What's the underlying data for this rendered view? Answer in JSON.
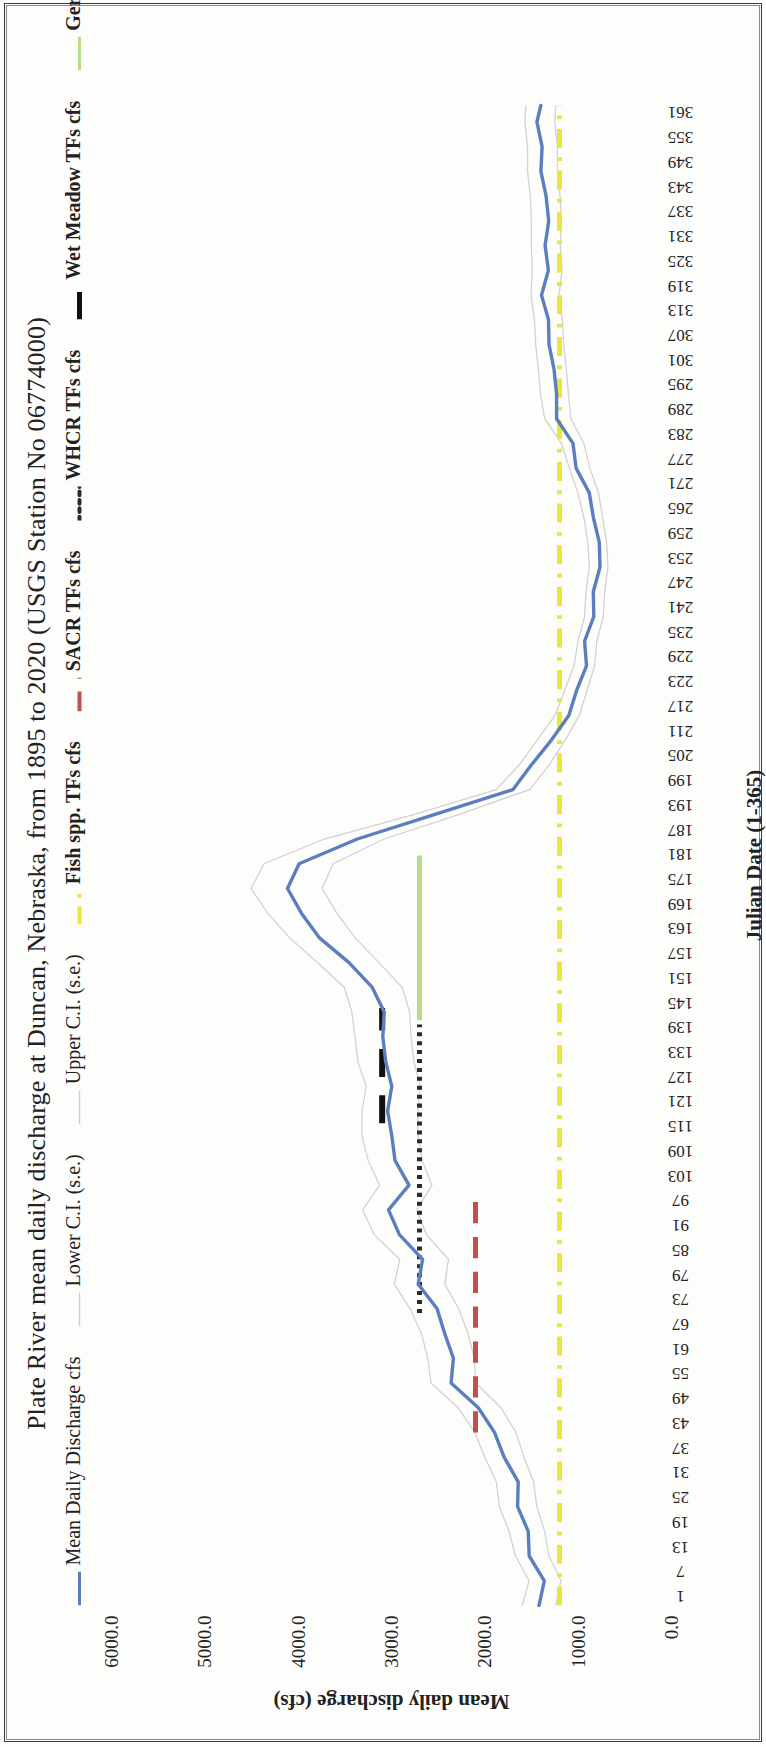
{
  "figure": {
    "title": "Plate River mean daily discharge at Duncan, Nebraska, from 1895 to 2020 (USGS Station No 06774000)"
  },
  "legend": {
    "position": "top",
    "items": [
      {
        "label": "Mean Daily Discharge cfs",
        "color": "#5b7fbe",
        "style": "solid",
        "width": 3,
        "bold": false
      },
      {
        "label": "Lower C.I. (s.e.)",
        "color": "#cfcfcf",
        "style": "solid",
        "width": 1.4,
        "bold": false
      },
      {
        "label": "Upper C.I. (s.e.)",
        "color": "#cfcfcf",
        "style": "solid",
        "width": 1.4,
        "bold": false
      },
      {
        "label": "Fish spp. TFs cfs",
        "color": "#eee53c",
        "style": "dash-dot",
        "width": 4,
        "bold": true
      },
      {
        "label": "SACR TFs cfs",
        "color": "#c0504d",
        "style": "long-dash",
        "width": 4,
        "bold": true
      },
      {
        "label": "WHCR  TFs cfs",
        "color": "#2b2b2b",
        "style": "dotted",
        "width": 4,
        "bold": true
      },
      {
        "label": "Wet Meadow TFs cfs",
        "color": "#111111",
        "style": "thick-dash",
        "width": 5,
        "bold": true
      },
      {
        "label": "Germination TFs cfs",
        "color": "#b9dd8c",
        "style": "solid",
        "width": 3,
        "bold": true
      }
    ]
  },
  "chart_data": {
    "type": "line",
    "title": "Plate River mean daily discharge at Duncan, Nebraska, from 1895 to 2020 (USGS Station No 06774000)",
    "xlabel": "Julian Date (1-365)",
    "ylabel": "Mean daily discharge (cfs)",
    "xlim": [
      1,
      365
    ],
    "ylim": [
      0,
      6000
    ],
    "grid": false,
    "legend_position": "top",
    "yticks": [
      "0.0",
      "1000.0",
      "2000.0",
      "3000.0",
      "4000.0",
      "5000.0",
      "6000.0"
    ],
    "ytick_values": [
      0,
      1000,
      2000,
      3000,
      4000,
      5000,
      6000
    ],
    "xticks": [
      "1",
      "7",
      "13",
      "19",
      "25",
      "31",
      "37",
      "43",
      "49",
      "55",
      "61",
      "67",
      "73",
      "79",
      "85",
      "91",
      "97",
      "103",
      "109",
      "115",
      "121",
      "127",
      "133",
      "139",
      "145",
      "151",
      "157",
      "163",
      "169",
      "175",
      "181",
      "187",
      "193",
      "199",
      "205",
      "211",
      "217",
      "223",
      "229",
      "235",
      "241",
      "247",
      "253",
      "259",
      "265",
      "271",
      "277",
      "283",
      "289",
      "295",
      "301",
      "307",
      "313",
      "319",
      "325",
      "331",
      "337",
      "343",
      "349",
      "355",
      "361"
    ],
    "series": [
      {
        "name": "Mean Daily Discharge cfs",
        "color": "#5b7fbe",
        "style": "solid",
        "x": [
          1,
          7,
          13,
          19,
          25,
          31,
          37,
          43,
          49,
          55,
          61,
          67,
          73,
          79,
          85,
          91,
          97,
          103,
          109,
          115,
          121,
          127,
          133,
          139,
          145,
          151,
          157,
          163,
          169,
          175,
          181,
          187,
          193,
          199,
          205,
          211,
          217,
          223,
          229,
          235,
          241,
          247,
          253,
          259,
          265,
          271,
          277,
          283,
          289,
          295,
          301,
          307,
          313,
          319,
          325,
          331,
          337,
          343,
          349,
          355,
          361,
          365
        ],
        "y": [
          1420,
          1350,
          1470,
          1560,
          1640,
          1700,
          1790,
          1880,
          2050,
          2320,
          2380,
          2430,
          2560,
          2690,
          2640,
          2900,
          3010,
          2870,
          2960,
          3030,
          3000,
          2970,
          3060,
          3090,
          3140,
          3190,
          3470,
          3720,
          3950,
          4130,
          4000,
          3420,
          2500,
          1700,
          1450,
          1290,
          1130,
          1030,
          950,
          880,
          830,
          800,
          790,
          810,
          840,
          900,
          960,
          1060,
          1210,
          1270,
          1290,
          1300,
          1320,
          1330,
          1340,
          1350,
          1360,
          1360,
          1370,
          1380,
          1390,
          1400
        ]
      },
      {
        "name": "Lower C.I. (s.e.)",
        "color": "#d2d2d2",
        "style": "solid",
        "x": [
          1,
          7,
          13,
          19,
          25,
          31,
          37,
          43,
          49,
          55,
          61,
          67,
          73,
          79,
          85,
          91,
          97,
          103,
          109,
          115,
          121,
          127,
          133,
          139,
          145,
          151,
          157,
          163,
          169,
          175,
          181,
          187,
          193,
          199,
          205,
          211,
          217,
          223,
          229,
          235,
          241,
          247,
          253,
          259,
          265,
          271,
          277,
          283,
          289,
          295,
          301,
          307,
          313,
          319,
          325,
          331,
          337,
          343,
          349,
          355,
          361,
          365
        ],
        "y": [
          1240,
          1180,
          1290,
          1370,
          1440,
          1500,
          1580,
          1660,
          1820,
          2080,
          2130,
          2180,
          2300,
          2420,
          2380,
          2620,
          2720,
          2590,
          2670,
          2730,
          2700,
          2680,
          2760,
          2790,
          2830,
          2880,
          3140,
          3370,
          3580,
          3750,
          3630,
          3100,
          2260,
          1520,
          1290,
          1140,
          1000,
          910,
          840,
          780,
          730,
          700,
          690,
          710,
          740,
          790,
          850,
          940,
          1070,
          1120,
          1140,
          1150,
          1170,
          1180,
          1180,
          1190,
          1200,
          1200,
          1210,
          1220,
          1230,
          1240
        ]
      },
      {
        "name": "Upper C.I. (s.e.)",
        "color": "#d2d2d2",
        "style": "solid",
        "x": [
          1,
          7,
          13,
          19,
          25,
          31,
          37,
          43,
          49,
          55,
          61,
          67,
          73,
          79,
          85,
          91,
          97,
          103,
          109,
          115,
          121,
          127,
          133,
          139,
          145,
          151,
          157,
          163,
          169,
          175,
          181,
          187,
          193,
          199,
          205,
          211,
          217,
          223,
          229,
          235,
          241,
          247,
          253,
          259,
          265,
          271,
          277,
          283,
          289,
          295,
          301,
          307,
          313,
          319,
          325,
          331,
          337,
          343,
          349,
          355,
          361,
          365
        ],
        "y": [
          1600,
          1520,
          1650,
          1750,
          1840,
          1900,
          2000,
          2100,
          2280,
          2560,
          2630,
          2680,
          2820,
          2960,
          2900,
          3180,
          3300,
          3150,
          3250,
          3330,
          3300,
          3260,
          3360,
          3390,
          3450,
          3500,
          3800,
          4070,
          4320,
          4510,
          4370,
          3740,
          2740,
          1880,
          1610,
          1440,
          1260,
          1150,
          1060,
          980,
          930,
          900,
          890,
          910,
          940,
          1010,
          1070,
          1180,
          1350,
          1420,
          1440,
          1450,
          1470,
          1480,
          1500,
          1500,
          1520,
          1520,
          1530,
          1540,
          1550,
          1560
        ]
      }
    ],
    "threshold_lines": [
      {
        "name": "Fish spp. TFs cfs",
        "value": 1200,
        "color": "#eee53c",
        "style": "dash-dot",
        "x_start": 1,
        "x_end": 365,
        "orientation": "horizontal"
      },
      {
        "name": "SACR TFs cfs",
        "value": 2100,
        "color": "#c0504d",
        "style": "long-dash",
        "x_start": 43,
        "x_end": 100,
        "orientation": "horizontal"
      },
      {
        "name": "WHCR  TFs cfs",
        "value": 2700,
        "color": "#2b2b2b",
        "style": "dotted",
        "x_start": 72,
        "x_end": 142,
        "orientation": "horizontal"
      },
      {
        "name": "Wet Meadow TFs cfs",
        "value": 3100,
        "color": "#111111",
        "style": "thick-dash",
        "x_start": 118,
        "x_end": 146,
        "orientation": "horizontal"
      },
      {
        "name": "Germination TFs cfs",
        "value": 2700,
        "color": "#b9dd8c",
        "style": "solid",
        "x_start": 143,
        "x_end": 183,
        "orientation": "horizontal"
      }
    ]
  }
}
